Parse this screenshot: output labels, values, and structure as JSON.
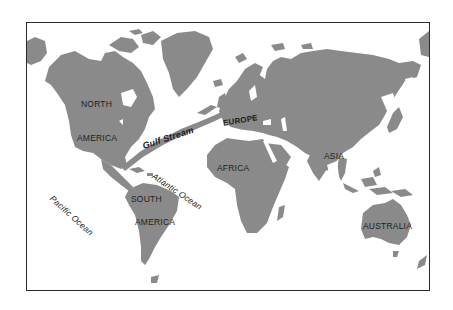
{
  "map": {
    "title": "World map showing the Gulf Stream",
    "land_color": "#8a8a8a",
    "water_color": "#ffffff",
    "stream_color": "#8a8a8a",
    "frame_color": "#2a2a2a",
    "labels": {
      "north": "NORTH",
      "america_n": "AMERICA",
      "europe": "EUROPE",
      "africa": "AFRICA",
      "asia": "ASIA",
      "australia": "AUSTRALIA",
      "south": "SOUTH",
      "america_s": "AMERICA",
      "gulf_stream": "Gulf Stream",
      "atlantic": "Atlantic Ocean",
      "pacific": "Pacific Ocean"
    }
  }
}
